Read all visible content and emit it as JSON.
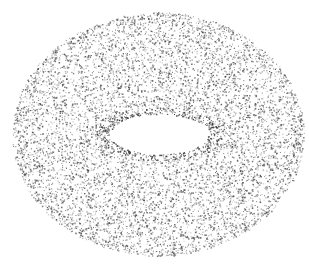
{
  "image": {
    "subject": "stippled torus point cloud",
    "background": "#ffffff",
    "dot_color": "#3a3a3a",
    "width": 309,
    "height": 267
  },
  "torus": {
    "outer": {
      "cx": 158,
      "cy": 134,
      "rx": 146,
      "ry": 122
    },
    "hole": {
      "cx": 159,
      "cy": 134,
      "rx": 49,
      "ry": 20
    },
    "point_count": 9000,
    "seed": 7
  }
}
